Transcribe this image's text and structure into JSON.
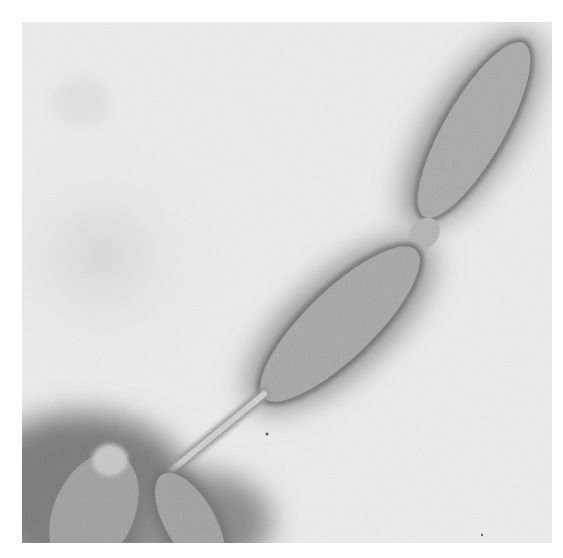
{
  "image": {
    "type": "grayscale-micrograph",
    "description": "Chain of spindle-shaped cells with a thin stalk leading to rounded cells at bottom-left",
    "colors": {
      "background": "#ececec",
      "halo": "#8a8a8a",
      "cell_body": "#a9a9a9",
      "cell_texture": "#9c9c9c",
      "stalk": "#c8c8c8",
      "dark_shadow": "#6a6a6a",
      "page_margin": "#ffffff"
    },
    "objects": [
      {
        "id": "upper-cell",
        "shape": "spindle"
      },
      {
        "id": "middle-cell",
        "shape": "spindle"
      },
      {
        "id": "stalk",
        "shape": "thin-rod"
      },
      {
        "id": "lower-left-cell",
        "shape": "rounded-rod"
      },
      {
        "id": "lower-center-cell",
        "shape": "rounded-rod"
      }
    ]
  }
}
